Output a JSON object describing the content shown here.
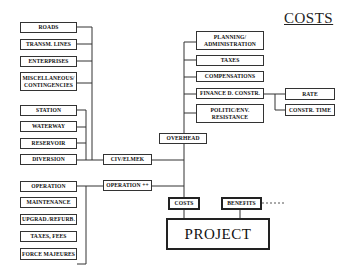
{
  "title": "COSTS",
  "left_groups": {
    "infrastructure": [
      "ROADS",
      "TRANSM. LINES",
      "ENTERPRISES",
      "MISCELLANEOUS/\nCONTINGENCIES"
    ],
    "civil": [
      "STATION",
      "WATERWAY",
      "RESERVOIR",
      "DIVERSION"
    ],
    "operation": [
      "OPERATION",
      "MAINTENANCE",
      "UPGRAD./REFURB.",
      "TAXES, FEES",
      "FORCE MAJEURES"
    ]
  },
  "middle": {
    "civ_elmek": "CIV/ELMEK",
    "operation_plus": "OPERATION ++",
    "overhead": "OVERHEAD"
  },
  "overhead_items": [
    "PLANNING/\nADMINISTRATION",
    "TAXES",
    "COMPENSATIONS",
    "FINANCE D. CONSTR.",
    "POLITIC/ENV.\nRESISTANCE"
  ],
  "finance_items": [
    "RATE",
    "CONSTR. TIME"
  ],
  "bottom": {
    "costs": "COSTS",
    "benefits": "BENEFITS",
    "project": "PROJECT"
  }
}
